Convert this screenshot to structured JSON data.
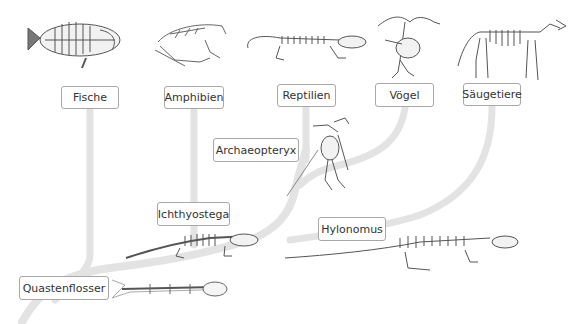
{
  "diagram": {
    "type": "phylogenetic-tree",
    "branch_color": "#e3e3e3",
    "skeleton_color": "#555555",
    "labels": {
      "fische": "Fische",
      "amphibien": "Amphibien",
      "reptilien": "Reptilien",
      "voegel": "Vögel",
      "saeugetiere": "Säugetiere",
      "archaeopteryx": "Archaeopteryx",
      "ichthyostega": "Ichthyostega",
      "hylonomus": "Hylonomus",
      "quastenflosser": "Quastenflosser"
    },
    "illustrations": [
      {
        "name": "fish-skeleton",
        "group": "Fische"
      },
      {
        "name": "frog-skeleton",
        "group": "Amphibien"
      },
      {
        "name": "lizard-skeleton",
        "group": "Reptilien"
      },
      {
        "name": "bird-skeleton",
        "group": "Vögel"
      },
      {
        "name": "dog-skeleton",
        "group": "Säugetiere"
      },
      {
        "name": "archaeopteryx-skeleton",
        "group": "Archaeopteryx"
      },
      {
        "name": "ichthyostega-skeleton",
        "group": "Ichthyostega"
      },
      {
        "name": "hylonomus-skeleton",
        "group": "Hylonomus"
      },
      {
        "name": "coelacanth-skeleton",
        "group": "Quastenflosser"
      }
    ]
  }
}
